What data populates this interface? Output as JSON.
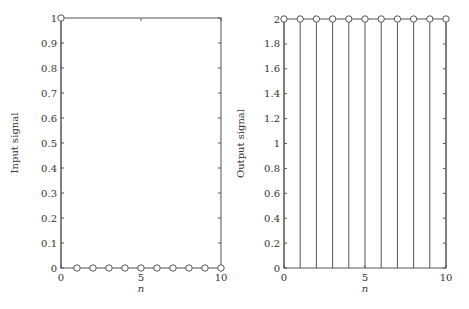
{
  "chart_data": [
    {
      "type": "stem",
      "title": "",
      "xlabel": "n",
      "ylabel": "Input signal",
      "x": [
        0,
        1,
        2,
        3,
        4,
        5,
        6,
        7,
        8,
        9,
        10
      ],
      "values": [
        1,
        0,
        0,
        0,
        0,
        0,
        0,
        0,
        0,
        0,
        0
      ],
      "xlim": [
        0,
        10
      ],
      "ylim": [
        0,
        1
      ],
      "xticks": [
        "0",
        "5",
        "10"
      ],
      "yticks": [
        "0",
        "0.1",
        "0.2",
        "0.3",
        "0.4",
        "0.5",
        "0.6",
        "0.7",
        "0.8",
        "0.9",
        "1"
      ],
      "grid": false,
      "marker": "circle-open"
    },
    {
      "type": "stem",
      "title": "",
      "xlabel": "n",
      "ylabel": "Output signal",
      "x": [
        0,
        1,
        2,
        3,
        4,
        5,
        6,
        7,
        8,
        9,
        10
      ],
      "values": [
        2,
        2,
        2,
        2,
        2,
        2,
        2,
        2,
        2,
        2,
        2
      ],
      "xlim": [
        0,
        10
      ],
      "ylim": [
        0,
        2
      ],
      "xticks": [
        "0",
        "5",
        "10"
      ],
      "yticks": [
        "0",
        "0.2",
        "0.4",
        "0.6",
        "0.8",
        "1",
        "1.2",
        "1.4",
        "1.6",
        "1.8",
        "2"
      ],
      "grid": false,
      "marker": "circle-open"
    }
  ],
  "colors": {
    "axis": "#555555",
    "stem": "#555555",
    "background": "#ffffff"
  }
}
